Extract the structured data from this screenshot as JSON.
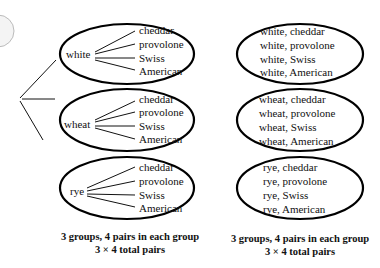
{
  "tree": {
    "groups": [
      {
        "bread": "white",
        "cheeses": [
          "cheddar",
          "provolone",
          "Swiss",
          "American"
        ]
      },
      {
        "bread": "wheat",
        "cheeses": [
          "cheddar",
          "provolone",
          "Swiss",
          "American"
        ]
      },
      {
        "bread": "rye",
        "cheeses": [
          "cheddar",
          "provolone",
          "Swiss",
          "American"
        ]
      }
    ],
    "caption_line1": "3 groups, 4 pairs in each group",
    "caption_line2": "3  ×  4  total pairs"
  },
  "pairs": {
    "groups": [
      [
        "white, cheddar",
        "white, provolone",
        "white, Swiss",
        "white, American"
      ],
      [
        "wheat, cheddar",
        "wheat, provolone",
        "wheat, Swiss",
        "wheat, American"
      ],
      [
        "rye, cheddar",
        "rye, provolone",
        "rye, Swiss",
        "rye, American"
      ]
    ],
    "caption_line1": "3 groups, 4 pairs in each group",
    "caption_line2": "3  ×  4  total pairs"
  }
}
